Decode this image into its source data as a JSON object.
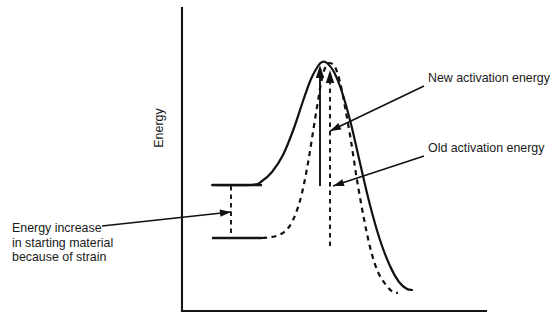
{
  "figure": {
    "kind": "reaction-energy-profile",
    "background_color": "#ffffff",
    "ink_color": "#111111"
  },
  "axes": {
    "y_axis_label": "Energy",
    "x_axis_label": "",
    "y_axis_top_y": 8,
    "y_axis_bottom_y": 311,
    "y_axis_x": 182,
    "x_axis_left_x": 182,
    "x_axis_right_x": 486,
    "x_axis_y": 311
  },
  "annotations": {
    "new_activation_energy": {
      "label": "New activation energy",
      "text_x": 428,
      "text_y": 82,
      "leader_from_x": 424,
      "leader_from_y": 86,
      "leader_to_x": 330,
      "leader_to_y": 131
    },
    "old_activation_energy": {
      "label": "Old activation energy",
      "text_x": 428,
      "text_y": 152,
      "leader_from_x": 424,
      "leader_from_y": 156,
      "leader_to_x": 333,
      "leader_to_y": 186
    },
    "energy_increase": {
      "lines": [
        "Energy increase",
        "in starting material",
        "because of strain"
      ],
      "text_x": 12,
      "text_y": 232,
      "line_height": 14.5,
      "leader_from_x": 102,
      "leader_from_y": 226,
      "leader_to_x": 231,
      "leader_to_y": 212
    }
  },
  "levels": {
    "strained_reactant": {
      "name": "Strained starting material level",
      "y": 185,
      "x_start": 212,
      "x_end": 262
    },
    "unstrained_reactant": {
      "name": "Unstrained starting material level",
      "y": 238,
      "x_start": 212,
      "x_end": 262
    },
    "connector": {
      "name": "Energy increase connector",
      "x": 231,
      "y_top": 186,
      "y_bottom": 237
    }
  },
  "measures": {
    "new_activation_arrow": {
      "name": "new-activation-energy-measure",
      "style": "solid",
      "x": 320,
      "y_base": 186,
      "y_tip": 65
    },
    "old_activation_arrow": {
      "name": "old-activation-energy-measure",
      "style": "dashed",
      "x": 330,
      "y_base": 246,
      "y_tip": 70
    }
  },
  "chart_data": {
    "type": "line",
    "title": "",
    "xlabel": "",
    "ylabel": "Energy",
    "grid": false,
    "legend": "none",
    "series": [
      {
        "name": "Strained (new) reaction pathway",
        "style": "solid",
        "description": "Starts at raised reactant level, lower activation barrier",
        "points": [
          [
            212,
            185
          ],
          [
            252,
            185
          ],
          [
            262,
            181
          ],
          [
            272,
            172
          ],
          [
            283,
            155
          ],
          [
            294,
            128
          ],
          [
            303,
            101
          ],
          [
            311,
            79
          ],
          [
            318,
            66
          ],
          [
            322,
            62
          ],
          [
            327,
            63
          ],
          [
            334,
            72
          ],
          [
            342,
            92
          ],
          [
            351,
            124
          ],
          [
            360,
            163
          ],
          [
            370,
            205
          ],
          [
            380,
            240
          ],
          [
            390,
            266
          ],
          [
            399,
            282
          ],
          [
            407,
            289
          ],
          [
            412,
            290
          ]
        ]
      },
      {
        "name": "Unstrained (old) reaction pathway",
        "style": "dashed",
        "description": "Starts at lower reactant level, higher activation barrier",
        "points": [
          [
            262,
            238
          ],
          [
            272,
            237
          ],
          [
            281,
            234
          ],
          [
            289,
            227
          ],
          [
            296,
            213
          ],
          [
            302,
            193
          ],
          [
            308,
            163
          ],
          [
            313,
            132
          ],
          [
            318,
            101
          ],
          [
            322,
            78
          ],
          [
            326,
            66
          ],
          [
            330,
            63
          ],
          [
            335,
            67
          ],
          [
            340,
            82
          ],
          [
            345,
            107
          ],
          [
            351,
            141
          ],
          [
            357,
            180
          ],
          [
            364,
            219
          ],
          [
            371,
            251
          ],
          [
            378,
            272
          ],
          [
            386,
            285
          ],
          [
            393,
            292
          ],
          [
            398,
            293
          ]
        ]
      }
    ]
  }
}
